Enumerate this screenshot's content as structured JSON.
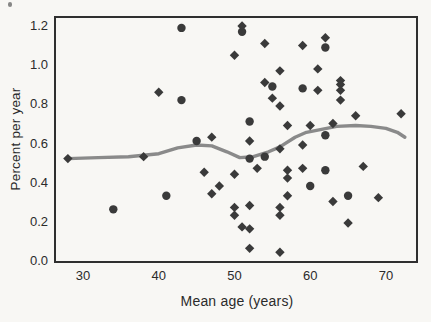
{
  "figure": {
    "background_color": "#f8f7f4",
    "frame_color": "#2f2f2f",
    "marker_color": "#3a3a3a",
    "trend_line_color": "#8a8a8a"
  },
  "chart_data": {
    "type": "scatter",
    "title": "",
    "xlabel": "Mean age (years)",
    "ylabel": "Percent per year",
    "grid": false,
    "legend": "none",
    "xlim": [
      26.3,
      74.1
    ],
    "ylim": [
      -0.01,
      1.246
    ],
    "x_ticks": {
      "values": [
        30,
        40,
        50,
        60,
        70
      ],
      "labels": [
        "30",
        "40",
        "50",
        "60",
        "70"
      ]
    },
    "y_ticks": {
      "values": [
        0.0,
        0.2,
        0.4,
        0.6,
        0.8,
        1.0,
        1.2
      ],
      "labels": [
        "0.0",
        "0.2",
        "0.4",
        "0.6",
        "0.8",
        "1.0",
        "1.2"
      ]
    },
    "series": [
      {
        "name": "circle-markers",
        "marker": "circle",
        "color": "#3a3a3a",
        "points": [
          [
            43,
            1.19
          ],
          [
            51,
            1.17
          ],
          [
            62,
            1.09
          ],
          [
            55,
            0.89
          ],
          [
            59,
            0.88
          ],
          [
            43,
            0.82
          ],
          [
            52,
            0.71
          ],
          [
            62,
            0.64
          ],
          [
            45,
            0.61
          ],
          [
            54,
            0.53
          ],
          [
            52,
            0.52
          ],
          [
            62,
            0.46
          ],
          [
            60,
            0.38
          ],
          [
            65,
            0.33
          ],
          [
            41,
            0.33
          ],
          [
            34,
            0.26
          ]
        ]
      },
      {
        "name": "diamond-markers",
        "marker": "diamond",
        "color": "#3a3a3a",
        "points": [
          [
            51,
            1.2
          ],
          [
            62,
            1.14
          ],
          [
            54,
            1.11
          ],
          [
            59,
            1.1
          ],
          [
            50,
            1.05
          ],
          [
            61,
            0.98
          ],
          [
            56,
            0.97
          ],
          [
            54,
            0.91
          ],
          [
            64,
            0.92
          ],
          [
            64,
            0.9
          ],
          [
            64,
            0.87
          ],
          [
            64,
            0.82
          ],
          [
            61,
            0.87
          ],
          [
            40,
            0.86
          ],
          [
            55,
            0.83
          ],
          [
            56,
            0.79
          ],
          [
            72,
            0.75
          ],
          [
            66,
            0.74
          ],
          [
            63,
            0.7
          ],
          [
            60,
            0.69
          ],
          [
            57,
            0.69
          ],
          [
            47,
            0.63
          ],
          [
            52,
            0.61
          ],
          [
            59,
            0.59
          ],
          [
            56,
            0.57
          ],
          [
            38,
            0.53
          ],
          [
            28,
            0.52
          ],
          [
            53,
            0.47
          ],
          [
            59,
            0.47
          ],
          [
            67,
            0.48
          ],
          [
            57,
            0.46
          ],
          [
            57,
            0.42
          ],
          [
            46,
            0.45
          ],
          [
            50,
            0.44
          ],
          [
            48,
            0.38
          ],
          [
            47,
            0.34
          ],
          [
            57,
            0.33
          ],
          [
            63,
            0.3
          ],
          [
            69,
            0.32
          ],
          [
            56,
            0.27
          ],
          [
            56,
            0.23
          ],
          [
            50,
            0.27
          ],
          [
            50,
            0.23
          ],
          [
            52,
            0.28
          ],
          [
            51,
            0.17
          ],
          [
            52,
            0.16
          ],
          [
            65,
            0.19
          ],
          [
            52,
            0.06
          ],
          [
            56,
            0.04
          ]
        ]
      },
      {
        "name": "smooth-trend-line",
        "marker": "none",
        "color": "#8a8a8a",
        "points": [
          [
            28,
            0.52
          ],
          [
            32,
            0.525
          ],
          [
            36,
            0.53
          ],
          [
            40,
            0.545
          ],
          [
            42.5,
            0.575
          ],
          [
            45,
            0.59
          ],
          [
            47,
            0.585
          ],
          [
            49,
            0.555
          ],
          [
            50.7,
            0.525
          ],
          [
            52.5,
            0.53
          ],
          [
            54.5,
            0.555
          ],
          [
            56,
            0.58
          ],
          [
            58,
            0.63
          ],
          [
            59.5,
            0.655
          ],
          [
            61.5,
            0.67
          ],
          [
            63.5,
            0.685
          ],
          [
            66,
            0.69
          ],
          [
            68,
            0.685
          ],
          [
            70,
            0.675
          ],
          [
            71.5,
            0.655
          ],
          [
            72.5,
            0.63
          ]
        ]
      }
    ]
  }
}
